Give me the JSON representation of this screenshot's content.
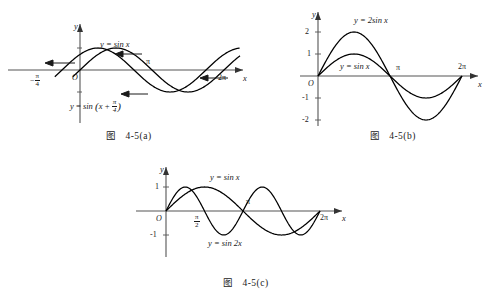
{
  "figure": {
    "panels": [
      {
        "id": "a",
        "caption": "图   4-5(a)",
        "axis": {
          "x_name": "x",
          "y_name": "y",
          "origin": "O"
        },
        "x_ticks": [
          {
            "label": "π",
            "x": 180
          },
          {
            "label": "2π",
            "x": 360
          }
        ],
        "x_fraction_ticks": [
          {
            "num": "π",
            "den": "4",
            "sign": "−",
            "x": -45
          }
        ],
        "y_ticks": [],
        "curve_labels": [
          {
            "text": "y = sin x",
            "kind": "plain"
          },
          {
            "text": "y = sin (x + π/4)",
            "kind": "fraction"
          }
        ],
        "arrows": 4
      },
      {
        "id": "b",
        "caption": "图   4-5(b)",
        "axis": {
          "x_name": "x",
          "y_name": "y",
          "origin": "O"
        },
        "x_ticks": [
          {
            "label": "π",
            "x": 180
          },
          {
            "label": "2π",
            "x": 360
          }
        ],
        "y_ticks": [
          "2",
          "1",
          "-1",
          "-2"
        ],
        "curve_labels": [
          {
            "text": "y = 2sin x",
            "kind": "plain"
          },
          {
            "text": "y = sin x",
            "kind": "plain"
          }
        ],
        "arrows": 0
      },
      {
        "id": "c",
        "caption": "图   4-5(c)",
        "axis": {
          "x_name": "x",
          "y_name": "y",
          "origin": "O"
        },
        "x_ticks": [
          {
            "label": "π",
            "x": 180
          },
          {
            "label": "2π",
            "x": 360
          }
        ],
        "x_fraction_ticks": [
          {
            "num": "π",
            "den": "2",
            "sign": "",
            "x": 90
          }
        ],
        "y_ticks": [
          "1",
          "-1"
        ],
        "curve_labels": [
          {
            "text": "y = sin x",
            "kind": "plain"
          },
          {
            "text": "y = sin 2x",
            "kind": "plain"
          }
        ],
        "arrows": 0
      }
    ]
  },
  "chart_data": [
    {
      "type": "line",
      "panel": "a",
      "title": "图 4-5(a)",
      "xlabel": "x",
      "ylabel": "y",
      "xlim": [
        -80,
        400
      ],
      "ylim": [
        -1.45,
        1.45
      ],
      "x_unit": "degrees",
      "grid": false,
      "legend": "inline-labels",
      "series": [
        {
          "name": "y = sin x",
          "formula": "sin(x)",
          "amplitude": 1,
          "phase_deg": 0,
          "period_deg": 360
        },
        {
          "name": "y = sin (x + π/4)",
          "formula": "sin(x + 45°)",
          "amplitude": 1,
          "phase_deg": 45,
          "period_deg": 360
        }
      ],
      "annotations": [
        {
          "text": "−π/4",
          "x": -45,
          "y": 0
        },
        {
          "text": "π",
          "x": 180,
          "y": 0
        },
        {
          "text": "2π",
          "x": 360,
          "y": 0
        }
      ],
      "shift_arrows": "leftward by π/4"
    },
    {
      "type": "line",
      "panel": "b",
      "title": "图 4-5(b)",
      "xlabel": "x",
      "ylabel": "y",
      "xlim": [
        -30,
        400
      ],
      "ylim": [
        -2.45,
        2.45
      ],
      "x_unit": "degrees",
      "grid": false,
      "legend": "inline-labels",
      "yticks": [
        2,
        1,
        -1,
        -2
      ],
      "series": [
        {
          "name": "y = 2sin x",
          "formula": "2*sin(x)",
          "amplitude": 2,
          "phase_deg": 0,
          "period_deg": 360
        },
        {
          "name": "y = sin x",
          "formula": "sin(x)",
          "amplitude": 1,
          "phase_deg": 0,
          "period_deg": 360
        }
      ],
      "annotations": [
        {
          "text": "π",
          "x": 180,
          "y": 0
        },
        {
          "text": "2π",
          "x": 360,
          "y": 0
        }
      ]
    },
    {
      "type": "line",
      "panel": "c",
      "title": "图 4-5(c)",
      "xlabel": "x",
      "ylabel": "y",
      "xlim": [
        -30,
        400
      ],
      "ylim": [
        -1.45,
        1.45
      ],
      "x_unit": "degrees",
      "grid": false,
      "legend": "inline-labels",
      "yticks": [
        1,
        -1
      ],
      "series": [
        {
          "name": "y = sin x",
          "formula": "sin(x)",
          "amplitude": 1,
          "phase_deg": 0,
          "period_deg": 360
        },
        {
          "name": "y = sin 2x",
          "formula": "sin(2x)",
          "amplitude": 1,
          "phase_deg": 0,
          "period_deg": 180
        }
      ],
      "annotations": [
        {
          "text": "π/2",
          "x": 90,
          "y": 0
        },
        {
          "text": "π",
          "x": 180,
          "y": 0
        },
        {
          "text": "2π",
          "x": 360,
          "y": 0
        }
      ]
    }
  ],
  "colors": {
    "ink": "#1a1a1a",
    "curve": "#000000",
    "axis": "#555555",
    "background": "#ffffff"
  }
}
